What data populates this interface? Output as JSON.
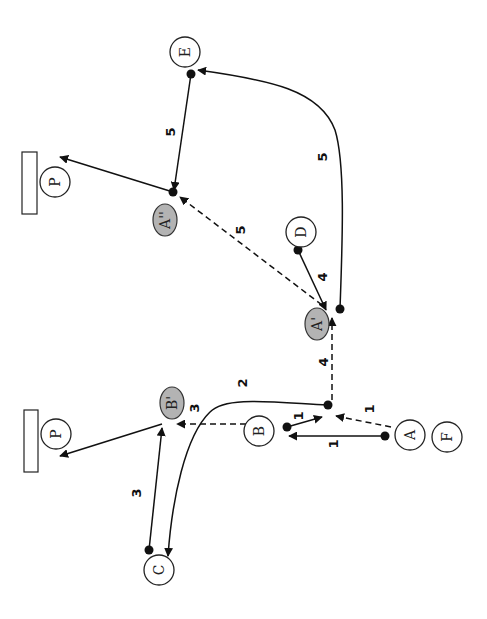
{
  "diagram": {
    "type": "movement/flow diagram (rotated 90°)",
    "nodes": [
      {
        "id": "E",
        "label": "E",
        "style": "white",
        "x": 185,
        "y": 52
      },
      {
        "id": "P_top",
        "label": "P",
        "style": "white",
        "x": 55,
        "y": 182
      },
      {
        "id": "A2",
        "label": "A''",
        "style": "gray",
        "x": 165,
        "y": 220
      },
      {
        "id": "D",
        "label": "D",
        "style": "white",
        "x": 301,
        "y": 232
      },
      {
        "id": "A1",
        "label": "A'",
        "style": "gray",
        "x": 318,
        "y": 324
      },
      {
        "id": "B1",
        "label": "B'",
        "style": "gray",
        "x": 172,
        "y": 403
      },
      {
        "id": "B",
        "label": "B",
        "style": "white",
        "x": 259,
        "y": 431
      },
      {
        "id": "A",
        "label": "A",
        "style": "white",
        "x": 410,
        "y": 435
      },
      {
        "id": "F",
        "label": "F",
        "style": "white",
        "x": 447,
        "y": 437
      },
      {
        "id": "P_bottom",
        "label": "P",
        "style": "white",
        "x": 56,
        "y": 434
      },
      {
        "id": "C",
        "label": "C",
        "style": "white",
        "x": 159,
        "y": 570
      }
    ],
    "targets": [
      {
        "id": "target-top",
        "x": 22,
        "y": 152,
        "w": 15,
        "h": 62
      },
      {
        "id": "target-bottom",
        "x": 24,
        "y": 410,
        "w": 14,
        "h": 62
      }
    ],
    "edges": [
      {
        "from": "A",
        "to": "B",
        "label": "1",
        "style": "solid"
      },
      {
        "from": "B",
        "to": "junction",
        "label": "1",
        "style": "solid"
      },
      {
        "from": "A",
        "to": "junction",
        "label": "1",
        "style": "dashed"
      },
      {
        "from": "junction",
        "to": "C",
        "label": "2",
        "style": "solid-curve"
      },
      {
        "from": "B",
        "to": "B'",
        "label": "3",
        "style": "dashed"
      },
      {
        "from": "C",
        "to": "B'",
        "label": "3",
        "style": "solid"
      },
      {
        "from": "B'",
        "to": "P_bottom",
        "label": "",
        "style": "solid"
      },
      {
        "from": "junction",
        "to": "A'",
        "label": "4",
        "style": "dashed"
      },
      {
        "from": "D",
        "to": "A'",
        "label": "4",
        "style": "solid"
      },
      {
        "from": "A'",
        "to": "E",
        "label": "5",
        "style": "solid-curve"
      },
      {
        "from": "A'",
        "to": "A''",
        "label": "5",
        "style": "dashed"
      },
      {
        "from": "E",
        "to": "A''",
        "label": "5",
        "style": "solid"
      },
      {
        "from": "A''",
        "to": "P_top",
        "label": "",
        "style": "solid"
      }
    ],
    "edge_labels": [
      {
        "text": "5",
        "x": 170,
        "y": 132
      },
      {
        "text": "5",
        "x": 322,
        "y": 157
      },
      {
        "text": "5",
        "x": 240,
        "y": 230
      },
      {
        "text": "4",
        "x": 322,
        "y": 277
      },
      {
        "text": "4",
        "x": 323,
        "y": 362
      },
      {
        "text": "2",
        "x": 242,
        "y": 383
      },
      {
        "text": "3",
        "x": 194,
        "y": 408
      },
      {
        "text": "1",
        "x": 298,
        "y": 416
      },
      {
        "text": "1",
        "x": 369,
        "y": 409
      },
      {
        "text": "1",
        "x": 333,
        "y": 444
      },
      {
        "text": "3",
        "x": 136,
        "y": 493
      }
    ],
    "colors": {
      "line": "#111111",
      "gray_node_fill": "#b3b3b3",
      "background": "#ffffff"
    }
  }
}
